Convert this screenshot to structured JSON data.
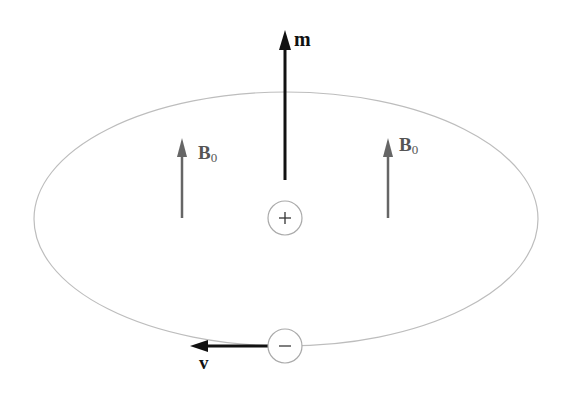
{
  "diagram": {
    "labels": {
      "magnetic_moment": "m",
      "velocity": "v",
      "field_left": "B",
      "field_left_sub": "0",
      "field_right": "B",
      "field_right_sub": "0",
      "positive_charge": "+",
      "negative_charge": "−"
    },
    "colors": {
      "orbit": "#b8b8b8",
      "field_arrow": "#666666",
      "moment_arrow": "#111111",
      "charge_circle": "#aaaaaa"
    }
  }
}
